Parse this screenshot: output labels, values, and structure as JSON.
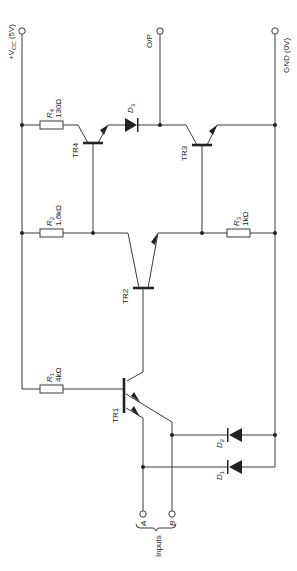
{
  "diagram": {
    "colors": {
      "line": "#3a3a3a",
      "background": "#ffffff"
    },
    "terminals": {
      "vcc": "+V",
      "vcc_sub": "CC",
      "vcc_value": " (5V)",
      "output": "O/P",
      "ground": "GND (0V)",
      "input_a": "A",
      "input_b": "B",
      "inputs_label": "Inputs"
    },
    "resistors": [
      {
        "id": "R4",
        "name": "R",
        "sub": "4",
        "value": "130Ω"
      },
      {
        "id": "R2",
        "name": "R",
        "sub": "2",
        "value": "1.6kΩ"
      },
      {
        "id": "R3",
        "name": "R",
        "sub": "3",
        "value": "1kΩ"
      },
      {
        "id": "R1",
        "name": "R",
        "sub": "1",
        "value": "4kΩ"
      }
    ],
    "transistors": [
      {
        "id": "TR4",
        "label": "TR4"
      },
      {
        "id": "TR3",
        "label": "TR3"
      },
      {
        "id": "TR2",
        "label": "TR2"
      },
      {
        "id": "TR1",
        "label": "TR1"
      }
    ],
    "diodes": [
      {
        "id": "D3",
        "name": "D",
        "sub": "3"
      },
      {
        "id": "D2",
        "name": "D",
        "sub": "2"
      },
      {
        "id": "D1",
        "name": "D",
        "sub": "1"
      }
    ]
  }
}
